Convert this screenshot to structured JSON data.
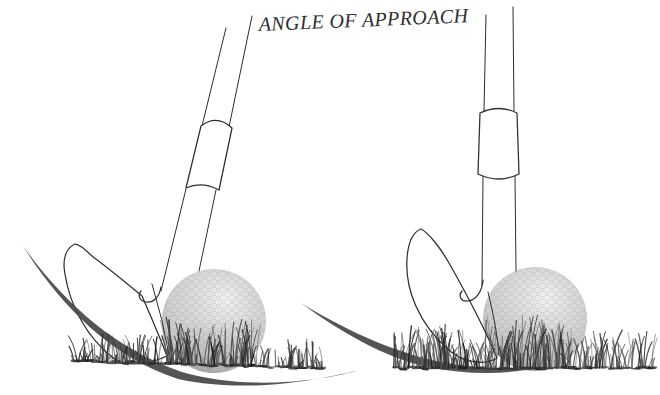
{
  "title": {
    "label": "ANGLE OF APPROACH"
  },
  "colors": {
    "background": "#ffffff",
    "ink": "#2e2e2e",
    "swing_arc": "#474747",
    "ball_highlight": "#f8f8f8",
    "ball_base": "#d4d4d4",
    "ball_edge": "#aeaeae",
    "grass_ink": "#1c1c1c"
  },
  "figure": {
    "kind": "golf-swing-angle-of-approach-comparison",
    "panels": [
      {
        "id": "left",
        "shaft_pose": "leaning-forward",
        "swing_path": "steep-descending-arc"
      },
      {
        "id": "right",
        "shaft_pose": "vertical",
        "swing_path": "shallow-sweeping-arc"
      }
    ]
  }
}
